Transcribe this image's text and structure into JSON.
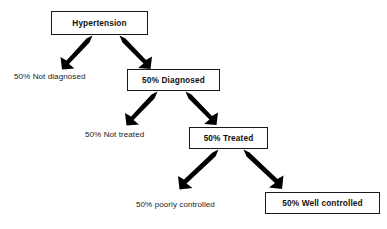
{
  "diagram": {
    "type": "flowchart",
    "background_color": "#ffffff",
    "line_color": "#1a1a1a",
    "arrow_color": "#000000",
    "nodes": [
      {
        "id": "hypertension",
        "label": "Hypertension",
        "style": "boxed",
        "emphasis": "bold",
        "level": 0
      },
      {
        "id": "not_diagnosed",
        "label": "50% Not diagnosed",
        "style": "plain",
        "emphasis": "normal",
        "level": 1
      },
      {
        "id": "diagnosed",
        "label": "50% Diagnosed",
        "style": "boxed",
        "emphasis": "bold",
        "level": 1
      },
      {
        "id": "not_treated",
        "label": "50% Not treated",
        "style": "plain",
        "emphasis": "normal",
        "level": 2
      },
      {
        "id": "treated",
        "label": "50% Treated",
        "style": "boxed",
        "emphasis": "bold",
        "level": 2
      },
      {
        "id": "poorly_controlled",
        "label": "50% poorly controlled",
        "style": "plain",
        "emphasis": "normal",
        "level": 3
      },
      {
        "id": "well_controlled",
        "label": "50% Well controlled",
        "style": "boxed",
        "emphasis": "bold",
        "level": 3
      }
    ],
    "edges": [
      {
        "from": "hypertension",
        "to": "not_diagnosed",
        "direction": "down-left"
      },
      {
        "from": "hypertension",
        "to": "diagnosed",
        "direction": "down-right"
      },
      {
        "from": "diagnosed",
        "to": "not_treated",
        "direction": "down-left"
      },
      {
        "from": "diagnosed",
        "to": "treated",
        "direction": "down-right"
      },
      {
        "from": "treated",
        "to": "poorly_controlled",
        "direction": "down-left"
      },
      {
        "from": "treated",
        "to": "well_controlled",
        "direction": "down-right"
      }
    ]
  }
}
